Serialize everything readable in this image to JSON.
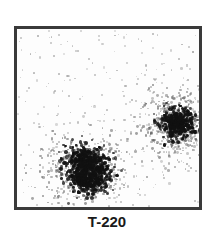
{
  "figure": {
    "type": "flow-cytometry-dot-plot",
    "caption": "T-220"
  },
  "chart_data": {
    "type": "scatter",
    "title": "",
    "xlabel": "",
    "ylabel": "",
    "caption": "T-220",
    "grid": false,
    "axis_ticks": "none",
    "clusters": [
      {
        "name": "lower-left population",
        "cx": 0.38,
        "cy": 0.22,
        "spread_x": 0.1,
        "spread_y": 0.09,
        "density": "high",
        "shape": "bilobed"
      },
      {
        "name": "right population",
        "cx": 0.87,
        "cy": 0.48,
        "spread_x": 0.08,
        "spread_y": 0.09,
        "density": "high",
        "shape": "round"
      }
    ],
    "background": "sparse scattered events across entire plot"
  },
  "colors": {
    "frame": "#3a3a3a",
    "dense": "#111111",
    "sparse": "#9a9a9a",
    "caption": "#1a1a1a"
  }
}
